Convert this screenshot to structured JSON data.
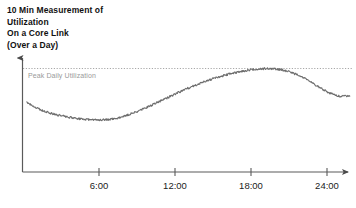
{
  "chart_data": {
    "type": "line",
    "title": "10 Min Measurement of Utilization On a Core Link (Over a Day)",
    "title_lines": [
      "10 Min Measurement of",
      "Utilization",
      "On a Core Link",
      "(Over a Day)"
    ],
    "xlabel": "",
    "ylabel": "",
    "xlim": [
      0,
      26
    ],
    "ylim": [
      0,
      100
    ],
    "grid": false,
    "legend": false,
    "xtick_labels": [
      "6:00",
      "12:00",
      "18:00",
      "24:00"
    ],
    "xtick_values": [
      6,
      12,
      18,
      24
    ],
    "annotations": [
      {
        "name": "peak-daily-utilization",
        "label": "Peak Daily Utilization",
        "type": "horizontal-threshold-line",
        "y": 78,
        "style": "dotted",
        "color": "#9a9a9a"
      }
    ],
    "series": [
      {
        "name": "Link utilization (10 min samples)",
        "color": "#6b6b6b",
        "style": "noisy-line",
        "x": [
          0.3,
          0.6,
          0.9,
          1.2,
          1.5,
          1.8,
          2.1,
          2.4,
          2.7,
          3.0,
          3.3,
          3.6,
          3.9,
          4.2,
          4.5,
          4.8,
          5.1,
          5.4,
          5.7,
          6.0,
          6.3,
          6.6,
          6.9,
          7.2,
          7.5,
          7.8,
          8.1,
          8.4,
          8.7,
          9.0,
          9.3,
          9.6,
          9.9,
          10.2,
          10.5,
          10.8,
          11.1,
          11.4,
          11.7,
          12.0,
          12.3,
          12.6,
          12.9,
          13.2,
          13.5,
          13.8,
          14.1,
          14.4,
          14.7,
          15.0,
          15.3,
          15.6,
          15.9,
          16.2,
          16.5,
          16.8,
          17.1,
          17.4,
          17.7,
          18.0,
          18.3,
          18.6,
          18.9,
          19.2,
          19.5,
          19.8,
          20.1,
          20.4,
          20.7,
          21.0,
          21.3,
          21.6,
          21.9,
          22.2,
          22.5,
          22.8,
          23.1,
          23.4,
          23.7,
          24.0,
          24.3,
          24.6,
          24.9,
          25.2,
          25.5,
          25.8
        ],
        "y": [
          50.0,
          48.0,
          46.2,
          44.6,
          43.2,
          42.0,
          41.0,
          40.1,
          39.3,
          38.6,
          38.0,
          37.4,
          36.9,
          36.4,
          36.0,
          35.7,
          35.4,
          35.2,
          35.1,
          35.0,
          35.1,
          35.3,
          35.7,
          36.2,
          36.9,
          37.7,
          38.6,
          39.7,
          40.8,
          42.0,
          43.3,
          44.7,
          46.1,
          47.6,
          49.1,
          50.6,
          52.1,
          53.6,
          55.1,
          56.6,
          58.1,
          59.5,
          60.9,
          62.3,
          63.6,
          64.9,
          66.1,
          67.3,
          68.4,
          69.5,
          70.5,
          71.4,
          72.3,
          73.1,
          73.9,
          74.6,
          75.3,
          75.9,
          76.4,
          76.9,
          77.3,
          77.6,
          77.8,
          77.9,
          77.9,
          77.7,
          77.4,
          76.9,
          76.2,
          75.3,
          74.2,
          72.9,
          71.4,
          69.8,
          68.0,
          66.2,
          64.3,
          62.4,
          60.5,
          58.7,
          57.2,
          56.0,
          55.2,
          54.8,
          55.0,
          55.6
        ]
      }
    ]
  },
  "axis": {
    "x_axis_name": "time-axis",
    "y_axis_name": "utilization-axis",
    "arrowheads": true
  }
}
